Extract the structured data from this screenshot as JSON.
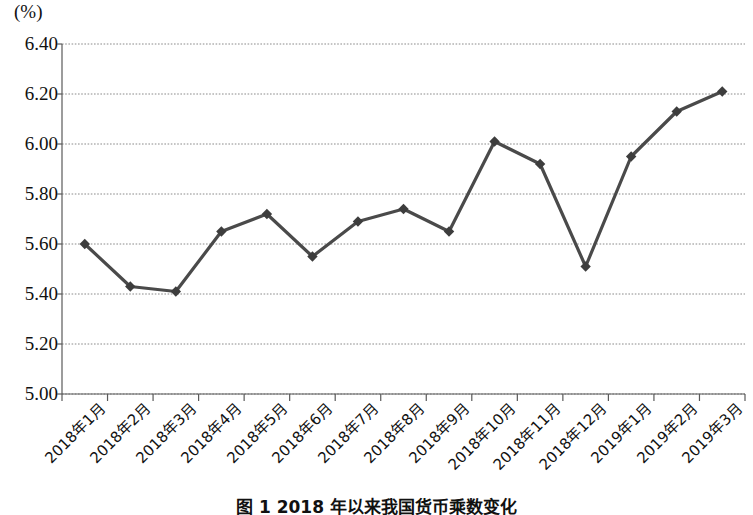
{
  "figure": {
    "unit_label": "(%)",
    "caption": "图 1  2018 年以来我国货币乘数变化"
  },
  "chart_data": {
    "type": "line",
    "title": "",
    "subtitle": "",
    "xlabel": "",
    "ylabel": "(%)",
    "ylim": [
      5.0,
      6.4
    ],
    "ytick_step": 0.2,
    "yticks": [
      "6.40",
      "6.20",
      "6.00",
      "5.80",
      "5.60",
      "5.40",
      "5.20",
      "5.00"
    ],
    "ytick_values": [
      6.4,
      6.2,
      6.0,
      5.8,
      5.6,
      5.4,
      5.2,
      5.0
    ],
    "grid": "horizontal-dotted",
    "legend": "none",
    "marker": "diamond",
    "line_color": "#4a4a4a",
    "marker_color": "#3d3d3d",
    "grid_color": "#8a8a8a",
    "axis_color": "#5a5a5a",
    "categories": [
      "2018年1月",
      "2018年2月",
      "2018年3月",
      "2018年4月",
      "2018年5月",
      "2018年6月",
      "2018年7月",
      "2018年8月",
      "2018年9月",
      "2018年10月",
      "2018年11月",
      "2018年12月",
      "2019年1月",
      "2019年2月",
      "2019年3月"
    ],
    "values": [
      5.6,
      5.43,
      5.41,
      5.65,
      5.72,
      5.55,
      5.69,
      5.74,
      5.65,
      6.01,
      5.92,
      5.51,
      5.95,
      6.13,
      6.21
    ]
  }
}
